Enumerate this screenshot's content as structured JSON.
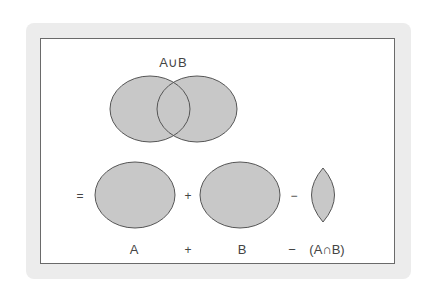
{
  "title": "A∪B",
  "colors": {
    "panel_bg": "#ececec",
    "frame_bg": "#ffffff",
    "frame_border": "#6a6a6a",
    "shape_fill": "#c8c8c8",
    "shape_stroke": "#555555",
    "text": "#444444"
  },
  "top_venn": {
    "label": "A∪B",
    "sets": [
      "A",
      "B"
    ]
  },
  "equation": {
    "operators": [
      "=",
      "+",
      "−"
    ],
    "shapes": [
      "set A",
      "set B",
      "intersection A∩B"
    ]
  },
  "bottom_labels": {
    "term1": "A",
    "op1": "+",
    "term2": "B",
    "op2": "−",
    "term3": "(A∩B)"
  },
  "symbols": {
    "equals": "=",
    "plus": "+",
    "minus": "−"
  }
}
